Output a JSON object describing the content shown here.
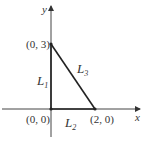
{
  "diagram": {
    "axes": {
      "x_label": "x",
      "y_label": "y"
    },
    "points": [
      {
        "id": "origin",
        "label": "(0, 0)",
        "x": 0,
        "y": 0
      },
      {
        "id": "p03",
        "label": "(0, 3)",
        "x": 0,
        "y": 3
      },
      {
        "id": "p20",
        "label": "(2, 0)",
        "x": 2,
        "y": 0
      }
    ],
    "segments": [
      {
        "id": "L1",
        "name": "L",
        "sub": "1",
        "from": "origin",
        "to": "p03"
      },
      {
        "id": "L2",
        "name": "L",
        "sub": "2",
        "from": "origin",
        "to": "p20"
      },
      {
        "id": "L3",
        "name": "L",
        "sub": "3",
        "from": "p03",
        "to": "p20"
      }
    ],
    "colors": {
      "line": "#222222",
      "text": "#333333"
    }
  }
}
